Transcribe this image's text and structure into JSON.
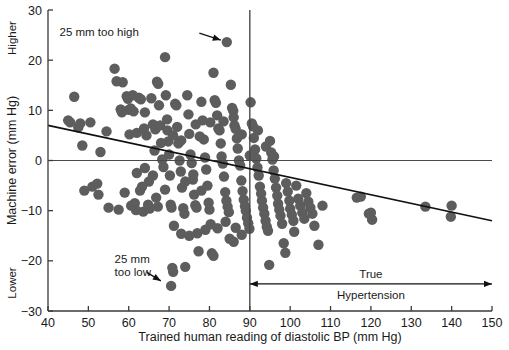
{
  "chart_data": {
    "type": "scatter",
    "title": "",
    "xlabel": "Trained human reading of diastolic BP (mm Hg)",
    "ylabel": "Machine error (mm Hg)",
    "xlim": [
      40,
      150
    ],
    "ylim": [
      -30,
      30
    ],
    "xticks": [
      40,
      50,
      60,
      70,
      80,
      90,
      100,
      110,
      120,
      130,
      140,
      150
    ],
    "yticks": [
      -30,
      -20,
      -10,
      0,
      10,
      20,
      30
    ],
    "xtick_labels": [
      "40",
      "50",
      "60",
      "70",
      "80",
      "90",
      "100",
      "110",
      "120",
      "130",
      "140",
      "150"
    ],
    "ytick_labels": [
      "-30",
      "-20",
      "-10",
      "0",
      "10",
      "20",
      "30"
    ],
    "grid": false,
    "legend": "none",
    "axis_end_labels": {
      "y_top": "Higher",
      "y_bottom": "Lower"
    },
    "reference_lines": [
      {
        "name": "zero-error-line",
        "orientation": "horizontal",
        "value": 0
      },
      {
        "name": "hypertension-threshold-line",
        "orientation": "vertical",
        "value": 90
      }
    ],
    "fit_line": {
      "name": "regression-line",
      "x_start": 40,
      "y_start": 7.0,
      "x_end": 150,
      "y_end": -12.0
    },
    "annotations": [
      {
        "name": "too-high-annotation",
        "text": "25 mm too high",
        "text_x": 62,
        "text_y": 25.6,
        "arrow_from_x": 77.5,
        "arrow_from_y": 25.4,
        "arrow_to_x": 84.3,
        "arrow_to_y": 23.6
      },
      {
        "name": "too-low-annotation",
        "line1": "25 mm",
        "line2": "too low",
        "text_x": 56.5,
        "text_y": -20.4,
        "arrow_from_x": 64.5,
        "arrow_from_y": -22.3,
        "arrow_to_x": 69.2,
        "arrow_to_y": -24.6
      },
      {
        "name": "true-hypertension-range",
        "line1": "True",
        "line2": "Hypertension",
        "range_start": 90,
        "range_end": 150,
        "y": -24.6
      }
    ],
    "marker": {
      "shape": "circle",
      "color": "#5d5d5d",
      "radius_px": 5.2
    },
    "points": [
      [
        45.0,
        8.0
      ],
      [
        45.5,
        7.6
      ],
      [
        46.5,
        12.7
      ],
      [
        47.5,
        6.6
      ],
      [
        48.0,
        7.4
      ],
      [
        48.5,
        3.0
      ],
      [
        50.5,
        7.6
      ],
      [
        51.0,
        -5.2
      ],
      [
        52.2,
        -4.6
      ],
      [
        53.0,
        1.7
      ],
      [
        54.5,
        5.8
      ],
      [
        56.5,
        18.3
      ],
      [
        57.0,
        15.8
      ],
      [
        58.5,
        15.6
      ],
      [
        58.0,
        10.2
      ],
      [
        58.3,
        9.6
      ],
      [
        59.5,
        12.8
      ],
      [
        59.8,
        12.3
      ],
      [
        60.0,
        10.1
      ],
      [
        60.5,
        10.4
      ],
      [
        60.6,
        -9.0
      ],
      [
        61.0,
        13.0
      ],
      [
        61.2,
        9.8
      ],
      [
        61.5,
        -8.5
      ],
      [
        61.8,
        -9.9
      ],
      [
        62.0,
        5.5
      ],
      [
        62.5,
        12.5
      ],
      [
        63.0,
        12.2
      ],
      [
        63.3,
        -5.2
      ],
      [
        63.6,
        -10.2
      ],
      [
        64.0,
        9.6
      ],
      [
        64.4,
        5.0
      ],
      [
        64.8,
        -8.8
      ],
      [
        65.2,
        -9.6
      ],
      [
        65.6,
        12.4
      ],
      [
        66.0,
        7.2
      ],
      [
        66.4,
        2.0
      ],
      [
        66.8,
        -7.4
      ],
      [
        67.0,
        15.7
      ],
      [
        67.3,
        15.3
      ],
      [
        67.5,
        11.0
      ],
      [
        67.8,
        7.0
      ],
      [
        68.0,
        3.5
      ],
      [
        68.3,
        0.2
      ],
      [
        68.6,
        -1.3
      ],
      [
        69.0,
        20.6
      ],
      [
        69.2,
        13.0
      ],
      [
        69.5,
        8.2
      ],
      [
        69.8,
        3.8
      ],
      [
        70.0,
        1.2
      ],
      [
        70.2,
        -3.0
      ],
      [
        70.4,
        -8.8
      ],
      [
        70.6,
        -9.4
      ],
      [
        70.8,
        -21.4
      ],
      [
        71.0,
        -22.2
      ],
      [
        70.5,
        -25.0
      ],
      [
        71.5,
        11.3
      ],
      [
        71.8,
        11.0
      ],
      [
        72.0,
        6.7
      ],
      [
        72.3,
        3.4
      ],
      [
        72.6,
        0.0
      ],
      [
        72.9,
        -2.2
      ],
      [
        73.2,
        -5.4
      ],
      [
        73.5,
        -9.5
      ],
      [
        73.8,
        -10.6
      ],
      [
        74.0,
        -21.2
      ],
      [
        74.5,
        13.0
      ],
      [
        74.8,
        9.2
      ],
      [
        75.0,
        5.3
      ],
      [
        75.3,
        1.2
      ],
      [
        75.6,
        -0.5
      ],
      [
        75.9,
        -3.8
      ],
      [
        76.2,
        -6.8
      ],
      [
        76.5,
        -8.9
      ],
      [
        76.8,
        -9.4
      ],
      [
        77.0,
        -14.5
      ],
      [
        77.3,
        -18.1
      ],
      [
        77.6,
        4.8
      ],
      [
        78.0,
        11.7
      ],
      [
        78.3,
        8.0
      ],
      [
        78.6,
        4.2
      ],
      [
        78.9,
        0.6
      ],
      [
        79.2,
        -1.8
      ],
      [
        79.5,
        -5.0
      ],
      [
        79.8,
        -8.4
      ],
      [
        80.0,
        -9.8
      ],
      [
        80.3,
        -12.7
      ],
      [
        80.6,
        -18.5
      ],
      [
        81.0,
        17.5
      ],
      [
        81.3,
        12.0
      ],
      [
        81.6,
        11.5
      ],
      [
        81.9,
        9.0
      ],
      [
        82.2,
        6.4
      ],
      [
        82.5,
        6.0
      ],
      [
        82.8,
        3.4
      ],
      [
        83.0,
        0.8
      ],
      [
        83.3,
        -0.6
      ],
      [
        83.6,
        -3.2
      ],
      [
        83.9,
        -6.3
      ],
      [
        84.2,
        -8.0
      ],
      [
        84.5,
        -9.2
      ],
      [
        84.8,
        -10.3
      ],
      [
        85.0,
        -15.6
      ],
      [
        84.3,
        23.6
      ],
      [
        85.3,
        15.1
      ],
      [
        85.6,
        10.5
      ],
      [
        85.9,
        9.9
      ],
      [
        86.2,
        7.0
      ],
      [
        86.5,
        6.3
      ],
      [
        86.8,
        4.4
      ],
      [
        87.0,
        2.4
      ],
      [
        87.3,
        0.0
      ],
      [
        87.6,
        -1.0
      ],
      [
        87.9,
        -4.0
      ],
      [
        88.2,
        -6.1
      ],
      [
        88.5,
        -7.8
      ],
      [
        88.8,
        -9.1
      ],
      [
        89.0,
        -10.0
      ],
      [
        89.3,
        -11.4
      ],
      [
        89.6,
        -12.5
      ],
      [
        89.9,
        -13.6
      ],
      [
        90.2,
        11.6
      ],
      [
        90.5,
        7.4
      ],
      [
        90.8,
        6.8
      ],
      [
        91.0,
        4.5
      ],
      [
        91.3,
        2.2
      ],
      [
        91.6,
        0.4
      ],
      [
        91.9,
        -1.4
      ],
      [
        92.2,
        -3.0
      ],
      [
        92.5,
        -5.2
      ],
      [
        92.8,
        -6.6
      ],
      [
        93.0,
        -8.0
      ],
      [
        93.3,
        -9.4
      ],
      [
        93.6,
        -10.6
      ],
      [
        93.9,
        -12.0
      ],
      [
        94.2,
        -13.2
      ],
      [
        94.5,
        -14.0
      ],
      [
        94.8,
        -20.8
      ],
      [
        95.0,
        3.9
      ],
      [
        95.3,
        1.6
      ],
      [
        95.6,
        0.2
      ],
      [
        95.9,
        -2.0
      ],
      [
        96.2,
        -3.6
      ],
      [
        96.5,
        -5.4
      ],
      [
        96.8,
        -7.0
      ],
      [
        97.0,
        -8.6
      ],
      [
        97.3,
        -9.8
      ],
      [
        97.6,
        -11.0
      ],
      [
        98.0,
        -12.6
      ],
      [
        98.4,
        -16.5
      ],
      [
        98.8,
        -18.4
      ],
      [
        99.0,
        -4.5
      ],
      [
        99.4,
        -6.2
      ],
      [
        99.8,
        -8.0
      ],
      [
        100.0,
        -9.6
      ],
      [
        100.4,
        -10.8
      ],
      [
        100.8,
        -12.0
      ],
      [
        101.0,
        -14.2
      ],
      [
        101.5,
        -5.0
      ],
      [
        102.0,
        -7.6
      ],
      [
        102.5,
        -9.0
      ],
      [
        103.0,
        -10.4
      ],
      [
        103.5,
        -11.6
      ],
      [
        104.0,
        -6.5
      ],
      [
        104.5,
        -8.2
      ],
      [
        105.0,
        -9.4
      ],
      [
        105.5,
        -10.6
      ],
      [
        106.0,
        -13.0
      ],
      [
        107.0,
        -16.8
      ],
      [
        108.0,
        -9.0
      ],
      [
        116.5,
        -7.4
      ],
      [
        117.5,
        -7.2
      ],
      [
        119.5,
        -10.6
      ],
      [
        120.0,
        -10.4
      ],
      [
        120.3,
        -11.8
      ],
      [
        133.5,
        -9.2
      ],
      [
        140.0,
        -9.0
      ],
      [
        139.8,
        -11.2
      ],
      [
        49.0,
        -6.0
      ],
      [
        52.5,
        -6.8
      ],
      [
        55.0,
        -9.4
      ],
      [
        57.5,
        -9.8
      ],
      [
        59.0,
        -6.4
      ],
      [
        62.8,
        -6.0
      ],
      [
        65.0,
        -4.2
      ],
      [
        67.2,
        -9.2
      ],
      [
        71.2,
        -13.0
      ],
      [
        73.0,
        -14.6
      ],
      [
        75.0,
        -15.0
      ],
      [
        79.0,
        -13.8
      ],
      [
        81.0,
        -19.0
      ],
      [
        86.0,
        -16.2
      ],
      [
        88.0,
        -14.8
      ],
      [
        64.0,
        -1.5
      ],
      [
        66.0,
        -3.0
      ],
      [
        62.0,
        -2.5
      ],
      [
        69.0,
        -5.8
      ],
      [
        74.0,
        -4.2
      ],
      [
        76.0,
        -2.8
      ],
      [
        78.0,
        -6.0
      ],
      [
        82.0,
        -13.5
      ],
      [
        84.0,
        -12.2
      ],
      [
        86.5,
        -13.4
      ],
      [
        60.2,
        5.2
      ],
      [
        63.8,
        6.4
      ],
      [
        66.6,
        6.2
      ],
      [
        69.6,
        6.0
      ],
      [
        71.0,
        5.0
      ],
      [
        73.0,
        4.0
      ],
      [
        76.6,
        7.2
      ],
      [
        80.2,
        7.6
      ],
      [
        83.5,
        7.8
      ],
      [
        86.0,
        8.6
      ],
      [
        88.0,
        5.2
      ],
      [
        90.0,
        1.0
      ],
      [
        92.0,
        6.0
      ],
      [
        94.0,
        2.8
      ],
      [
        96.0,
        0.8
      ]
    ]
  }
}
